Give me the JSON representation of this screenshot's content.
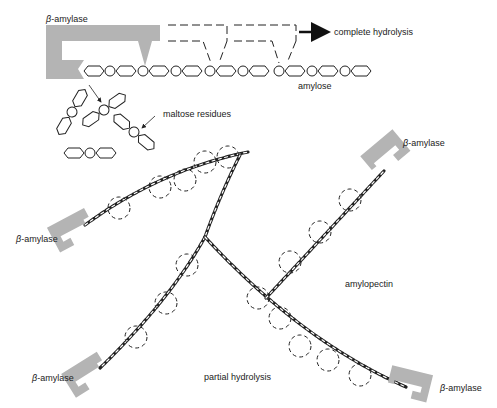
{
  "diagram": {
    "colors": {
      "enzyme": "#b4b4b4",
      "ink": "#222222",
      "background": "#ffffff"
    },
    "top": {
      "enzyme_label_greek": "β",
      "enzyme_label_rest": "-amylase",
      "arrow_label": "complete hydrolysis",
      "chain_label": "amylose",
      "products_label": "maltose residues"
    },
    "bottom": {
      "enzyme_label_greek": "β",
      "enzyme_label_rest": "-amylase",
      "enzymes": [
        {
          "id": "upper-left"
        },
        {
          "id": "upper-right"
        },
        {
          "id": "lower-left"
        },
        {
          "id": "lower-right"
        }
      ],
      "molecule_label": "amylopectin",
      "process_label": "partial hydrolysis"
    }
  }
}
